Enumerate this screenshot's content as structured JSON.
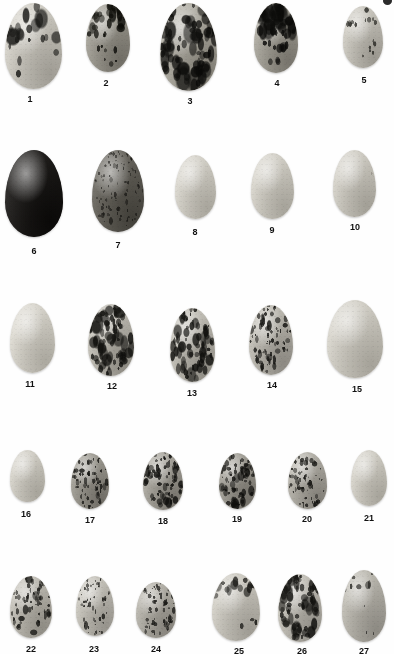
{
  "plate": {
    "title": "Bird egg identification plate",
    "description": "Grayscale photographic plate of 27 numbered bird eggs arranged in five rows",
    "background_color": "#fefefe",
    "label_color": "#111111",
    "corner_artifact": "page-edge-mark",
    "rows": [
      {
        "id": "row-1",
        "labels": [
          "1",
          "2",
          "3",
          "4",
          "5"
        ]
      },
      {
        "id": "row-2",
        "labels": [
          "6",
          "7",
          "8",
          "9",
          "10"
        ]
      },
      {
        "id": "row-3",
        "labels": [
          "11",
          "12",
          "13",
          "14",
          "15"
        ]
      },
      {
        "id": "row-4",
        "labels": [
          "16",
          "17",
          "18",
          "19",
          "20",
          "21"
        ]
      },
      {
        "id": "row-5",
        "labels": [
          "22",
          "23",
          "24",
          "25",
          "26",
          "27"
        ]
      }
    ]
  },
  "eggs": [
    {
      "label": "1",
      "x": 5,
      "y": 3,
      "w": 57,
      "h": 86,
      "label_x": 30,
      "label_y": 94,
      "base": "#d8d5cc",
      "shade": "#9d9a92",
      "pattern": "blotches-top",
      "spot_color": "#1d1d1b",
      "density": 0.3,
      "spot_size": 7
    },
    {
      "label": "2",
      "x": 86,
      "y": 4,
      "w": 44,
      "h": 68,
      "label_x": 106,
      "label_y": 78,
      "base": "#a9a69c",
      "shade": "#6e6b63",
      "pattern": "blotches-top",
      "spot_color": "#15150f",
      "density": 0.46,
      "spot_size": 5
    },
    {
      "label": "3",
      "x": 160,
      "y": 3,
      "w": 57,
      "h": 88,
      "label_x": 190,
      "label_y": 96,
      "base": "#b8b5ab",
      "shade": "#7d7a71",
      "pattern": "blotches-heavy",
      "spot_color": "#121210",
      "density": 0.52,
      "spot_size": 7
    },
    {
      "label": "4",
      "x": 254,
      "y": 3,
      "w": 44,
      "h": 70,
      "label_x": 277,
      "label_y": 78,
      "base": "#b0ada3",
      "shade": "#75726a",
      "pattern": "blotches-cap",
      "spot_color": "#0f0f0d",
      "density": 0.58,
      "spot_size": 8
    },
    {
      "label": "5",
      "x": 343,
      "y": 6,
      "w": 40,
      "h": 62,
      "label_x": 364,
      "label_y": 75,
      "base": "#d2cfc6",
      "shade": "#98958d",
      "pattern": "speckle-cap",
      "spot_color": "#2a2a26",
      "density": 0.3,
      "spot_size": 3
    },
    {
      "label": "6",
      "x": 5,
      "y": 150,
      "w": 58,
      "h": 87,
      "label_x": 34,
      "label_y": 246,
      "base": "#201e1c",
      "shade": "#0a0908",
      "pattern": "solid-dark",
      "spot_color": "#070707",
      "density": 0.85,
      "spot_size": 4
    },
    {
      "label": "7",
      "x": 92,
      "y": 150,
      "w": 52,
      "h": 82,
      "label_x": 118,
      "label_y": 240,
      "base": "#6d6a62",
      "shade": "#403e38",
      "pattern": "dense-fine",
      "spot_color": "#201f1b",
      "density": 0.7,
      "spot_size": 3
    },
    {
      "label": "8",
      "x": 175,
      "y": 155,
      "w": 41,
      "h": 64,
      "label_x": 195,
      "label_y": 227,
      "base": "#dedbd2",
      "shade": "#a6a39a",
      "pattern": "plain",
      "spot_color": "#bdbab2",
      "density": 0.02,
      "spot_size": 2
    },
    {
      "label": "9",
      "x": 251,
      "y": 153,
      "w": 43,
      "h": 66,
      "label_x": 272,
      "label_y": 225,
      "base": "#dcd9d0",
      "shade": "#a4a198",
      "pattern": "plain",
      "spot_color": "#bdbab2",
      "density": 0.02,
      "spot_size": 2
    },
    {
      "label": "10",
      "x": 333,
      "y": 150,
      "w": 43,
      "h": 67,
      "label_x": 355,
      "label_y": 222,
      "base": "#d9d6cd",
      "shade": "#a09d94",
      "pattern": "plain-faint",
      "spot_color": "#8d8a82",
      "density": 0.07,
      "spot_size": 2
    },
    {
      "label": "11",
      "x": 10,
      "y": 303,
      "w": 45,
      "h": 70,
      "label_x": 30,
      "label_y": 379,
      "base": "#e1ded5",
      "shade": "#a9a69d",
      "pattern": "plain",
      "spot_color": "#c2bfb7",
      "density": 0.02,
      "spot_size": 2
    },
    {
      "label": "12",
      "x": 88,
      "y": 304,
      "w": 46,
      "h": 72,
      "label_x": 112,
      "label_y": 381,
      "base": "#c9c6bd",
      "shade": "#8b8880",
      "pattern": "blotches-heavy",
      "spot_color": "#191916",
      "density": 0.55,
      "spot_size": 5
    },
    {
      "label": "13",
      "x": 170,
      "y": 308,
      "w": 45,
      "h": 74,
      "label_x": 192,
      "label_y": 388,
      "base": "#cac7be",
      "shade": "#8e8b83",
      "pattern": "blotches-heavy",
      "spot_color": "#1a1a17",
      "density": 0.5,
      "spot_size": 5
    },
    {
      "label": "14",
      "x": 249,
      "y": 305,
      "w": 44,
      "h": 70,
      "label_x": 272,
      "label_y": 380,
      "base": "#c6c3ba",
      "shade": "#8a8780",
      "pattern": "speckle-dense",
      "spot_color": "#191916",
      "density": 0.52,
      "spot_size": 4
    },
    {
      "label": "15",
      "x": 327,
      "y": 300,
      "w": 56,
      "h": 78,
      "label_x": 357,
      "label_y": 384,
      "base": "#dcd9d0",
      "shade": "#a3a097",
      "pattern": "plain",
      "spot_color": "#c0bdb5",
      "density": 0.02,
      "spot_size": 2
    },
    {
      "label": "16",
      "x": 10,
      "y": 450,
      "w": 35,
      "h": 52,
      "label_x": 26,
      "label_y": 509,
      "base": "#dbd8cf",
      "shade": "#a5a299",
      "pattern": "plain",
      "spot_color": "#c0bdb5",
      "density": 0.02,
      "spot_size": 2
    },
    {
      "label": "17",
      "x": 71,
      "y": 453,
      "w": 38,
      "h": 56,
      "label_x": 90,
      "label_y": 515,
      "base": "#a5a299",
      "shade": "#6f6c65",
      "pattern": "speckle-dense",
      "spot_color": "#232320",
      "density": 0.48,
      "spot_size": 3
    },
    {
      "label": "18",
      "x": 143,
      "y": 452,
      "w": 40,
      "h": 58,
      "label_x": 163,
      "label_y": 516,
      "base": "#b0ada4",
      "shade": "#76736c",
      "pattern": "speckle-dense",
      "spot_color": "#1b1b18",
      "density": 0.5,
      "spot_size": 4
    },
    {
      "label": "19",
      "x": 219,
      "y": 453,
      "w": 37,
      "h": 56,
      "label_x": 237,
      "label_y": 514,
      "base": "#a8a59c",
      "shade": "#716e67",
      "pattern": "speckle-dense",
      "spot_color": "#1a1a17",
      "density": 0.55,
      "spot_size": 4
    },
    {
      "label": "20",
      "x": 288,
      "y": 452,
      "w": 39,
      "h": 57,
      "label_x": 307,
      "label_y": 514,
      "base": "#bbb8af",
      "shade": "#807d76",
      "pattern": "speckle-fine",
      "spot_color": "#232320",
      "density": 0.45,
      "spot_size": 3
    },
    {
      "label": "21",
      "x": 351,
      "y": 450,
      "w": 36,
      "h": 56,
      "label_x": 369,
      "label_y": 513,
      "base": "#dbd8cf",
      "shade": "#a5a299",
      "pattern": "plain",
      "spot_color": "#c0bdb5",
      "density": 0.02,
      "spot_size": 2
    },
    {
      "label": "22",
      "x": 10,
      "y": 576,
      "w": 42,
      "h": 62,
      "label_x": 31,
      "label_y": 644,
      "base": "#c8c5bc",
      "shade": "#8d8a82",
      "pattern": "speckle-dense",
      "spot_color": "#232320",
      "density": 0.42,
      "spot_size": 4
    },
    {
      "label": "23",
      "x": 76,
      "y": 576,
      "w": 38,
      "h": 60,
      "label_x": 94,
      "label_y": 644,
      "base": "#cecbc2",
      "shade": "#94918a",
      "pattern": "speckle-fine",
      "spot_color": "#262623",
      "density": 0.38,
      "spot_size": 3
    },
    {
      "label": "24",
      "x": 136,
      "y": 582,
      "w": 40,
      "h": 56,
      "label_x": 156,
      "label_y": 644,
      "base": "#bcb9b0",
      "shade": "#84817a",
      "pattern": "speckle-dense",
      "spot_color": "#232320",
      "density": 0.46,
      "spot_size": 3
    },
    {
      "label": "25",
      "x": 212,
      "y": 573,
      "w": 48,
      "h": 68,
      "label_x": 239,
      "label_y": 646,
      "base": "#d6d3ca",
      "shade": "#9c9991",
      "pattern": "speckle-cap",
      "spot_color": "#1d1d1a",
      "density": 0.28,
      "spot_size": 5
    },
    {
      "label": "26",
      "x": 278,
      "y": 574,
      "w": 44,
      "h": 68,
      "label_x": 302,
      "label_y": 646,
      "base": "#cbc8bf",
      "shade": "#908d86",
      "pattern": "blotches-heavy",
      "spot_color": "#1a1a17",
      "density": 0.5,
      "spot_size": 5
    },
    {
      "label": "27",
      "x": 342,
      "y": 570,
      "w": 44,
      "h": 72,
      "label_x": 364,
      "label_y": 646,
      "base": "#c3c0b7",
      "shade": "#8b8881",
      "pattern": "band-top",
      "spot_color": "#20201d",
      "density": 0.32,
      "spot_size": 4
    }
  ]
}
